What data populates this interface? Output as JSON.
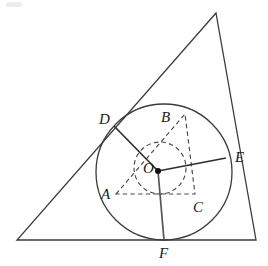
{
  "figure": {
    "stroke_color": "#3a3a3a",
    "dash_color": "#4a4a4a",
    "label_color": "#1a1a1a",
    "background": "#ffffff"
  },
  "labels": {
    "A": "A",
    "B": "B",
    "C": "C",
    "D": "D",
    "E": "E",
    "F": "F",
    "O": "O"
  },
  "chart_data": {
    "type": "diagram",
    "outer_triangle": {
      "name": "circumscribing-triangle",
      "vertices": [
        {
          "name": "top",
          "x": 216,
          "y": 13
        },
        {
          "name": "bottom-right",
          "x": 256,
          "y": 240
        },
        {
          "name": "bottom-left",
          "x": 17,
          "y": 240
        }
      ],
      "style": "solid"
    },
    "incircle": {
      "name": "large-circle",
      "cx": 164,
      "cy": 172,
      "r": 68,
      "style": "solid"
    },
    "tangent_points": [
      {
        "label": "D",
        "x": 114,
        "y": 126,
        "label_x": 99,
        "label_y": 112
      },
      {
        "label": "E",
        "x": 226,
        "y": 158,
        "label_x": 235,
        "label_y": 150
      },
      {
        "label": "F",
        "x": 164,
        "y": 240,
        "label_x": 159,
        "label_y": 246
      }
    ],
    "center": {
      "label": "O",
      "x": 158,
      "y": 171,
      "label_x": 143,
      "label_y": 161,
      "dot_r": 3
    },
    "radii": [
      {
        "name": "radius-OD",
        "from": "O",
        "to": "D"
      },
      {
        "name": "radius-OE",
        "from": "O",
        "to": "E"
      },
      {
        "name": "radius-OF",
        "from": "O",
        "to": "F"
      }
    ],
    "inner_triangle": {
      "name": "inner-dashed-triangle",
      "style": "dashed",
      "vertices": [
        {
          "label": "A",
          "x": 116,
          "y": 194,
          "label_x": 101,
          "label_y": 187
        },
        {
          "label": "B",
          "x": 185,
          "y": 114,
          "label_x": 161,
          "label_y": 110
        },
        {
          "label": "C",
          "x": 195,
          "y": 194,
          "label_x": 193,
          "label_y": 200
        }
      ]
    },
    "inner_circle": {
      "name": "inner-dashed-circle",
      "cx": 160,
      "cy": 168,
      "r": 26,
      "style": "dashed"
    }
  }
}
